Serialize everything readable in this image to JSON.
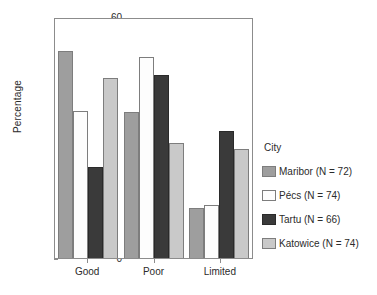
{
  "chart_data": {
    "type": "bar",
    "title": "",
    "xlabel": "",
    "ylabel": "Percentage",
    "categories": [
      "Good",
      "Poor",
      "Limited"
    ],
    "ylim": [
      0,
      60
    ],
    "yticks": [
      0,
      10,
      20,
      30,
      40,
      50,
      60
    ],
    "ytick_labels": [
      "0",
      "10",
      "20",
      "30",
      "40",
      "50",
      "60"
    ],
    "grid": false,
    "legend_position": "right",
    "legend_title": "City",
    "series": [
      {
        "name": "Maribor (N = 72)",
        "short_name": "Maribor",
        "n": 72,
        "color": "#9e9e9e",
        "values": [
          51.5,
          36.3,
          12.5
        ]
      },
      {
        "name": "Pécs (N = 74)",
        "short_name": "Pécs",
        "n": 74,
        "color": "#fdfdfd",
        "values": [
          36.5,
          50.0,
          13.2
        ]
      },
      {
        "name": "Tartu (N = 66)",
        "short_name": "Tartu",
        "n": 66,
        "color": "#3a3a3a",
        "values": [
          22.7,
          45.5,
          31.6
        ]
      },
      {
        "name": "Katowice (N = 74)",
        "short_name": "Katowice",
        "n": 74,
        "color": "#c9c9c9",
        "values": [
          44.7,
          28.6,
          27.2
        ]
      }
    ]
  }
}
